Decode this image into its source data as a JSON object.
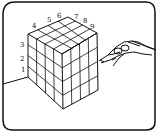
{
  "figure": {
    "labels": [
      "1",
      "2",
      "3",
      "4",
      "5",
      "6",
      "7",
      "8",
      "9"
    ],
    "colors": {
      "ink": "#111111",
      "background": "#ffffff"
    }
  }
}
